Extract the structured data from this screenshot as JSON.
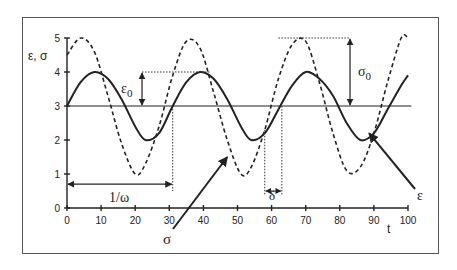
{
  "chart_data": {
    "type": "line",
    "title": "",
    "xlabel": "t",
    "ylabel": "ε, σ",
    "xlim": [
      0,
      100
    ],
    "ylim": [
      0,
      5
    ],
    "x_ticks": [
      0,
      10,
      20,
      30,
      40,
      50,
      60,
      70,
      80,
      90,
      100
    ],
    "y_ticks": [
      0,
      1,
      2,
      3,
      4,
      5
    ],
    "grid": false,
    "legend": null,
    "series": [
      {
        "name": "ε",
        "style": "solid",
        "description": "strain: 3 + 1·sin(ωt), period ≈ 31",
        "x": [
          0,
          4,
          8,
          12,
          16,
          20,
          23,
          27,
          31,
          35,
          39,
          43,
          47,
          51,
          54,
          58,
          62,
          66,
          70,
          74,
          78,
          82,
          86,
          90,
          94,
          98,
          100
        ],
        "values": [
          3.0,
          3.7,
          4.0,
          3.8,
          3.2,
          2.4,
          2.0,
          2.2,
          3.0,
          3.7,
          4.0,
          3.8,
          3.2,
          2.4,
          2.0,
          2.2,
          2.9,
          3.6,
          4.0,
          3.8,
          3.3,
          2.5,
          2.0,
          2.2,
          2.9,
          3.6,
          3.9
        ]
      },
      {
        "name": "σ",
        "style": "dashed",
        "description": "stress: 3 + 2·sin(ωt + δ), leads ε by δ ≈ 5",
        "x": [
          0,
          4,
          8,
          12,
          16,
          20,
          23,
          27,
          31,
          35,
          39,
          43,
          47,
          51,
          54,
          58,
          62,
          66,
          70,
          74,
          78,
          82,
          86,
          90,
          94,
          98,
          100
        ],
        "values": [
          4.5,
          5.0,
          4.6,
          3.3,
          1.9,
          1.0,
          1.3,
          2.4,
          3.9,
          4.9,
          4.7,
          3.4,
          2.0,
          1.0,
          1.2,
          2.3,
          3.8,
          4.8,
          4.9,
          3.7,
          2.2,
          1.1,
          1.2,
          2.2,
          3.7,
          5.0,
          5.0
        ]
      }
    ],
    "reference_line": {
      "y": 3,
      "style": "solid"
    },
    "annotations": [
      {
        "label": "ε0",
        "type": "amplitude",
        "from": 3,
        "to": 4,
        "x": 22
      },
      {
        "label": "σ0",
        "type": "amplitude",
        "from": 3,
        "to": 5,
        "x": 83
      },
      {
        "label": "1/ω",
        "type": "interval",
        "from": 0,
        "to": 31,
        "y": 0.7
      },
      {
        "label": "δ",
        "type": "interval",
        "from": 58,
        "to": 63,
        "y": 0.5
      },
      {
        "label": "σ",
        "type": "arrow-label",
        "points_to": [
          47,
          1.5
        ]
      },
      {
        "label": "ε",
        "type": "arrow-label",
        "points_to": [
          88,
          2.2
        ]
      }
    ]
  },
  "labels": {
    "ylabel": "ε, σ",
    "xlabel": "t",
    "eps0": "ε",
    "eps0_sub": "0",
    "sig0": "σ",
    "sig0_sub": "0",
    "inv_omega": "1/ω",
    "delta": "δ",
    "sigma_arrow": "σ",
    "eps_arrow": "ε"
  }
}
